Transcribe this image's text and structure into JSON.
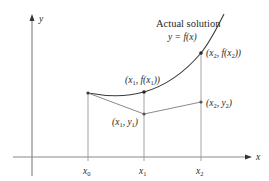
{
  "diagram": {
    "colors": {
      "axis": "#8a8a8a",
      "curve": "#3a3a3a",
      "segment": "#8a8a8a",
      "point": "#3a3a3a",
      "text": "#2a2a2a"
    },
    "axes": {
      "x_label": "x",
      "y_label": "y"
    },
    "curve_label": {
      "line1": "Actual solution",
      "line2": "y = f(x)"
    },
    "ticks": [
      {
        "label": "x0",
        "text": "x",
        "sub": "0"
      },
      {
        "label": "x1",
        "text": "x",
        "sub": "1"
      },
      {
        "label": "x2",
        "text": "x",
        "sub": "2"
      }
    ],
    "points": {
      "x1_fx1": "(x1, f(x1))",
      "x2_fx2": "(x2, f(x2))",
      "x1_y1": "(x1, y1)",
      "x2_y2": "(x2, y2)"
    }
  }
}
